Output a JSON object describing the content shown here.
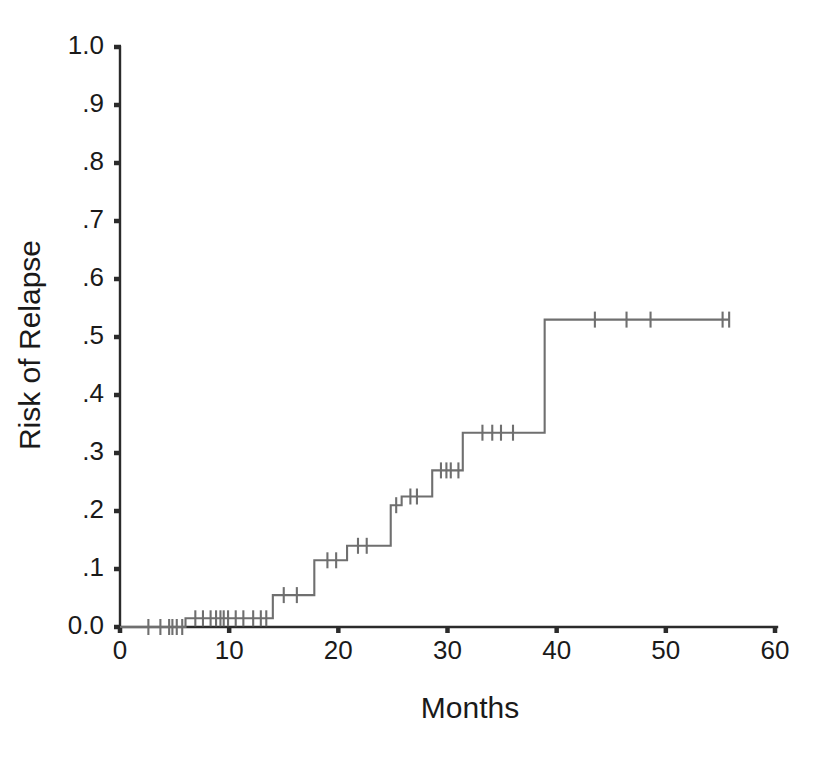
{
  "figure": {
    "background_color": "#ffffff",
    "curve_color": "#6f6f6f",
    "axis_color": "#2b2b2b"
  },
  "chart_data": {
    "type": "line",
    "subtype": "kaplan-meier-step-cumulative-incidence",
    "title": "",
    "xlabel": "Months",
    "ylabel": "Risk of Relapse",
    "xlim": [
      0,
      60
    ],
    "ylim": [
      0.0,
      1.0
    ],
    "grid": false,
    "legend": null,
    "xticks": [
      0,
      10,
      20,
      30,
      40,
      50,
      60
    ],
    "xtick_labels": [
      "0",
      "10",
      "20",
      "30",
      "40",
      "50",
      "60"
    ],
    "yticks": [
      0.0,
      0.1,
      0.2,
      0.3,
      0.4,
      0.5,
      0.6,
      0.7,
      0.8,
      0.9,
      1.0
    ],
    "ytick_labels": [
      "0.0",
      ".1",
      ".2",
      ".3",
      ".4",
      ".5",
      ".6",
      ".7",
      ".8",
      ".9",
      "1.0"
    ],
    "series": [
      {
        "name": "Risk of Relapse",
        "step_type": "post",
        "x": [
          0.0,
          6.0,
          14.0,
          17.8,
          20.8,
          24.8,
          25.8,
          28.6,
          31.4,
          38.9,
          55.8
        ],
        "y": [
          0.0,
          0.015,
          0.055,
          0.115,
          0.14,
          0.21,
          0.225,
          0.27,
          0.335,
          0.53,
          0.53
        ],
        "censor_x": [
          2.6,
          3.7,
          4.5,
          4.8,
          5.2,
          5.7,
          6.9,
          7.6,
          8.3,
          8.8,
          9.2,
          9.5,
          9.9,
          10.6,
          11.3,
          12.2,
          12.9,
          13.4,
          15.0,
          16.2,
          19.0,
          19.8,
          21.8,
          22.6,
          25.3,
          26.6,
          27.2,
          29.4,
          29.9,
          30.3,
          31.0,
          33.2,
          34.1,
          34.9,
          36.0,
          43.5,
          46.4,
          48.6,
          55.2,
          55.8
        ],
        "censor_y": [
          0.0,
          0.0,
          0.0,
          0.0,
          0.0,
          0.0,
          0.015,
          0.015,
          0.015,
          0.015,
          0.015,
          0.015,
          0.015,
          0.015,
          0.015,
          0.015,
          0.015,
          0.015,
          0.055,
          0.055,
          0.115,
          0.115,
          0.14,
          0.14,
          0.21,
          0.225,
          0.225,
          0.27,
          0.27,
          0.27,
          0.27,
          0.335,
          0.335,
          0.335,
          0.335,
          0.53,
          0.53,
          0.53,
          0.53,
          0.53
        ]
      }
    ],
    "annotations": []
  }
}
